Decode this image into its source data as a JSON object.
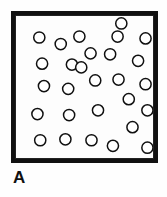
{
  "figure": {
    "panel_label": "A",
    "colors": {
      "frame": "#111111",
      "inner_rule": "#222222",
      "background": "#ffffff",
      "particle_fill": "#ffffff",
      "particle_stroke": "#101010",
      "label": "#111111"
    },
    "frame": {
      "x": 11,
      "y": 11,
      "width": 147,
      "height": 152,
      "border_width": 4
    }
  },
  "chart_data": {
    "type": "scatter",
    "title": "A",
    "xlabel": "",
    "ylabel": "",
    "xlim": [
      0,
      147
    ],
    "ylim": [
      0,
      152
    ],
    "grid": false,
    "legend": null,
    "marker": "open-circle",
    "marker_diameter": 12,
    "count": 28,
    "series": [
      {
        "name": "particles",
        "points": [
          {
            "x": 25,
            "y": 23
          },
          {
            "x": 48,
            "y": 30
          },
          {
            "x": 68,
            "y": 22
          },
          {
            "x": 109,
            "y": 22
          },
          {
            "x": 139,
            "y": 24
          },
          {
            "x": 80,
            "y": 40
          },
          {
            "x": 101,
            "y": 41
          },
          {
            "x": 28,
            "y": 51
          },
          {
            "x": 60,
            "y": 52
          },
          {
            "x": 131,
            "y": 48
          },
          {
            "x": 85,
            "y": 69
          },
          {
            "x": 110,
            "y": 68
          },
          {
            "x": 30,
            "y": 75
          },
          {
            "x": 56,
            "y": 78
          },
          {
            "x": 139,
            "y": 73
          },
          {
            "x": 121,
            "y": 89
          },
          {
            "x": 23,
            "y": 105
          },
          {
            "x": 57,
            "y": 106
          },
          {
            "x": 88,
            "y": 101
          },
          {
            "x": 141,
            "y": 101
          },
          {
            "x": 125,
            "y": 119
          },
          {
            "x": 26,
            "y": 133
          },
          {
            "x": 53,
            "y": 132
          },
          {
            "x": 81,
            "y": 133
          },
          {
            "x": 104,
            "y": 139
          },
          {
            "x": 141,
            "y": 141
          },
          {
            "x": 70,
            "y": 55
          },
          {
            "x": 113,
            "y": 8
          }
        ]
      }
    ]
  }
}
